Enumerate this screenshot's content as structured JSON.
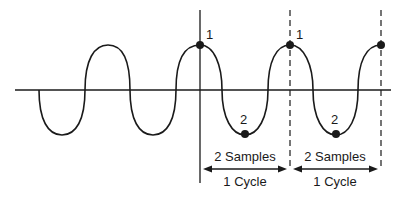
{
  "diagram": {
    "sample_labels": [
      "1",
      "2",
      "1",
      "2"
    ],
    "segments": [
      {
        "samples_label": "2 Samples",
        "cycle_label": "1 Cycle"
      },
      {
        "samples_label": "2 Samples",
        "cycle_label": "1 Cycle"
      }
    ],
    "colors": {
      "stroke": "#1a1a1a",
      "background": "#ffffff"
    }
  }
}
